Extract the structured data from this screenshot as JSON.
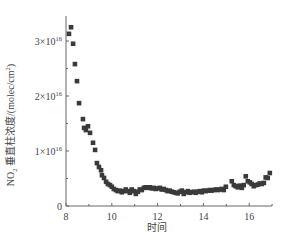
{
  "chart_data": {
    "type": "scatter",
    "title": "",
    "xlabel": "时间",
    "ylabel": "NO2 垂直柱浓度/(molec/cm2)",
    "ylabel_parts": {
      "pre": "NO",
      "sub": "2",
      "mid": " 垂直柱浓度/(molec/cm",
      "sup": "2",
      "post": ")"
    },
    "xlim": [
      8,
      17
    ],
    "ylim": [
      0,
      3.3e+16
    ],
    "x_ticks": [
      8,
      10,
      12,
      14,
      16
    ],
    "x_tick_labels": [
      "8",
      "10",
      "12",
      "14",
      "16"
    ],
    "y_ticks": [
      0,
      1e+16,
      2e+16,
      3e+16
    ],
    "y_tick_labels": [
      {
        "base": "0",
        "exp": ""
      },
      {
        "base": "1×10",
        "exp": "16"
      },
      {
        "base": "2×10",
        "exp": "16"
      },
      {
        "base": "3×10",
        "exp": "16"
      }
    ],
    "grid": false,
    "legend": null,
    "marker": "square",
    "marker_color": "#3a3a3a",
    "series": [
      {
        "name": "NO2 VCD",
        "x": [
          8.13,
          8.22,
          8.31,
          8.39,
          8.48,
          8.57,
          8.74,
          8.79,
          8.87,
          8.96,
          9.05,
          9.18,
          9.27,
          9.35,
          9.44,
          9.53,
          9.57,
          9.66,
          9.75,
          9.83,
          9.92,
          10.0,
          10.09,
          10.18,
          10.26,
          10.35,
          10.44,
          10.53,
          10.61,
          10.7,
          10.79,
          10.87,
          10.96,
          11.05,
          11.14,
          11.22,
          11.31,
          11.4,
          11.48,
          11.57,
          11.66,
          11.75,
          11.83,
          11.92,
          12.01,
          12.1,
          12.18,
          12.27,
          12.36,
          12.44,
          12.53,
          12.62,
          12.71,
          12.79,
          12.88,
          12.97,
          13.06,
          13.14,
          13.23,
          13.32,
          13.4,
          13.49,
          13.58,
          13.67,
          13.75,
          13.84,
          13.93,
          14.02,
          14.1,
          14.19,
          14.28,
          14.36,
          14.45,
          14.54,
          14.63,
          14.71,
          14.8,
          14.89,
          14.98,
          15.24,
          15.33,
          15.41,
          15.5,
          15.59,
          15.68,
          15.76,
          15.85,
          15.94,
          16.03,
          16.11,
          16.2,
          16.29,
          16.38,
          16.46,
          16.55,
          16.64,
          16.72,
          16.81,
          16.9
        ],
        "y": [
          3.13e+16,
          3.25e+16,
          2.95e+16,
          2.58e+16,
          2.27e+16,
          1.87e+16,
          1.58e+16,
          1.42e+16,
          1.38e+16,
          1.45e+16,
          1.33e+16,
          1.15e+16,
          1.02e+16,
          7800000000000000.0,
          7100000000000000.0,
          6500000000000000.0,
          5600000000000000.0,
          5100000000000000.0,
          4400000000000000.0,
          4000000000000000.0,
          3800000000000000.0,
          3500000000000000.0,
          3100000000000000.0,
          2900000000000000.0,
          2700000000000000.0,
          2800000000000000.0,
          2500000000000000.0,
          2700000000000000.0,
          3000000000000000.0,
          2700000000000000.0,
          2400000000000000.0,
          3000000000000000.0,
          2700000000000000.0,
          2200000000000000.0,
          2600000000000000.0,
          3000000000000000.0,
          2900000000000000.0,
          3300000000000000.0,
          3400000000000000.0,
          3300000000000000.0,
          3400000000000000.0,
          3200000000000000.0,
          3300000000000000.0,
          3100000000000000.0,
          3200000000000000.0,
          3300000000000000.0,
          3000000000000000.0,
          3100000000000000.0,
          2900000000000000.0,
          2700000000000000.0,
          2800000000000000.0,
          2600000000000000.0,
          2500000000000000.0,
          2400000000000000.0,
          2300000000000000.0,
          2600000000000000.0,
          2800000000000000.0,
          2200000000000000.0,
          2500000000000000.0,
          2700000000000000.0,
          2400000000000000.0,
          2500000000000000.0,
          2600000000000000.0,
          2400000000000000.0,
          2600000000000000.0,
          2700000000000000.0,
          2500000000000000.0,
          2800000000000000.0,
          2700000000000000.0,
          2800000000000000.0,
          2900000000000000.0,
          2800000000000000.0,
          2900000000000000.0,
          3000000000000000.0,
          2900000000000000.0,
          3000000000000000.0,
          3100000000000000.0,
          2900000000000000.0,
          3500000000000000.0,
          4500000000000000.0,
          3800000000000000.0,
          3600000000000000.0,
          3400000000000000.0,
          3700000000000000.0,
          3300000000000000.0,
          3800000000000000.0,
          5400000000000000.0,
          4500000000000000.0,
          4300000000000000.0,
          4000000000000000.0,
          3600000000000000.0,
          3800000000000000.0,
          3900000000000000.0,
          4100000000000000.0,
          4000000000000000.0,
          4200000000000000.0,
          5200000000000000.0,
          5100000000000000.0,
          6000000000000000.0
        ]
      }
    ]
  },
  "layout": {
    "plot_left": 66,
    "plot_right": 272,
    "plot_top": 16,
    "plot_bottom": 206,
    "x_min": 8,
    "x_max": 17,
    "px_per_x": 22.9,
    "y_min": 0,
    "y_unit": 1e+16,
    "px_per_y_unit": 55
  }
}
